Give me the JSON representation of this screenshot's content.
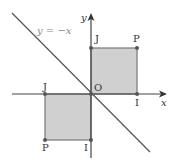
{
  "diagram": {
    "title": "",
    "colors": {
      "axis": "#444444",
      "line": "#555555",
      "square_fill": "#d0d0d0",
      "square_stroke": "#777777",
      "point": "#555555",
      "label": "#333333",
      "equation_label": "#8a8a8a"
    },
    "axes": {
      "x_label": "x",
      "y_label": "y",
      "origin_label": "O"
    },
    "line": {
      "label": "y = −x"
    },
    "squares": [
      {
        "name": "original",
        "quadrant": "I",
        "vertices": [
          {
            "label": "O",
            "x": 0,
            "y": 0
          },
          {
            "label": "I",
            "x": 1,
            "y": 0
          },
          {
            "label": "P",
            "x": 1,
            "y": 1
          },
          {
            "label": "J",
            "x": 0,
            "y": 1
          }
        ]
      },
      {
        "name": "image",
        "quadrant": "III",
        "vertices": [
          {
            "label": "O",
            "x": 0,
            "y": 0
          },
          {
            "label": "I",
            "x": 0,
            "y": -1
          },
          {
            "label": "P",
            "x": -1,
            "y": -1
          },
          {
            "label": "J",
            "x": -1,
            "y": 0
          }
        ]
      }
    ],
    "point_labels": {
      "upper_J": "J",
      "upper_P": "P",
      "upper_I": "I",
      "lower_J": "J",
      "lower_P": "P",
      "lower_I": "I"
    }
  }
}
